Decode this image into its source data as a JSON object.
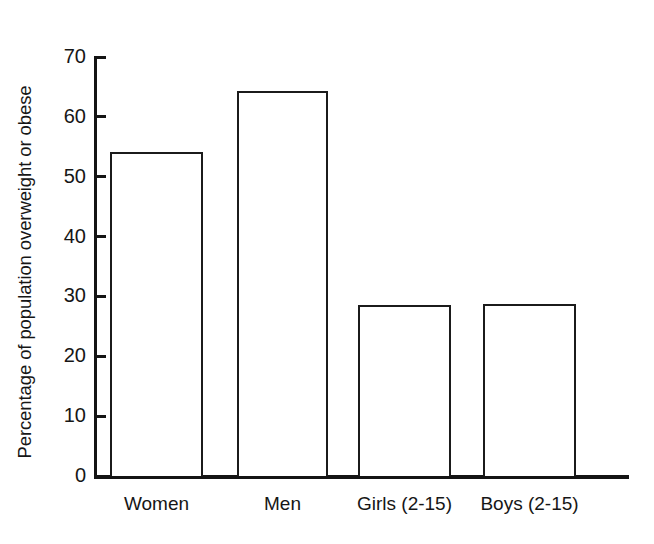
{
  "chart_data": {
    "type": "bar",
    "title": "",
    "xlabel": "",
    "ylabel": "Percentage of population overweight or obese",
    "categories": [
      "Women",
      "Men",
      "Girls (2-15)",
      "Boys (2-15)"
    ],
    "values": [
      54.1,
      64.4,
      28.5,
      28.7
    ],
    "ylim": [
      0,
      70
    ],
    "ytick_labels": [
      "70",
      "60",
      "50",
      "40",
      "30",
      "20",
      "10",
      "0"
    ],
    "ytick_values": [
      70,
      60,
      50,
      40,
      30,
      20,
      10,
      0
    ],
    "grid": false,
    "legend": null,
    "series": [
      {
        "name": "Percentage overweight or obese",
        "values": [
          54.1,
          64.4,
          28.5,
          28.7
        ]
      }
    ],
    "bar_style": {
      "fill": "#ffffff",
      "outline": "#1b1b1b"
    }
  },
  "axes": {
    "y_title": "Percentage of population overweight or obese",
    "ticks": [
      {
        "label": "70",
        "value": 70
      },
      {
        "label": "60",
        "value": 60
      },
      {
        "label": "50",
        "value": 50
      },
      {
        "label": "40",
        "value": 40
      },
      {
        "label": "30",
        "value": 30
      },
      {
        "label": "20",
        "value": 20
      },
      {
        "label": "10",
        "value": 10
      },
      {
        "label": "0",
        "value": 0
      }
    ]
  },
  "bars": [
    {
      "label": "Women",
      "value": 54.1,
      "left": 110,
      "width": 93
    },
    {
      "label": "Men",
      "value": 64.4,
      "left": 237,
      "width": 91
    },
    {
      "label": "Girls (2-15)",
      "value": 28.5,
      "left": 358,
      "width": 93
    },
    {
      "label": "Boys (2-15)",
      "value": 28.7,
      "left": 483,
      "width": 93
    }
  ],
  "geometry": {
    "baseline_y": 476,
    "top_y": 57,
    "px_per_unit": 5.9857
  }
}
